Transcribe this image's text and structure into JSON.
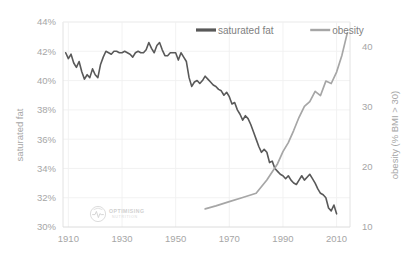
{
  "chart_data": {
    "type": "line",
    "title": "",
    "subtitle": "",
    "xlabel": "",
    "ylabel": "saturated fat",
    "y2label": "obesity (% BMI > 30)",
    "grid": true,
    "legend_position": "top-center",
    "xlim": [
      1908,
      2015
    ],
    "ylim": [
      30,
      44
    ],
    "y2lim": [
      10,
      44
    ],
    "xticks": [
      1910,
      1930,
      1950,
      1970,
      1990,
      2010
    ],
    "xtick_labels": [
      "1910",
      "1930",
      "1950",
      "1970",
      "1990",
      "2010"
    ],
    "yticks": [
      30,
      32,
      34,
      36,
      38,
      40,
      42,
      44
    ],
    "ytick_labels": [
      "30%",
      "32%",
      "34%",
      "36%",
      "38%",
      "40%",
      "42%",
      "44%"
    ],
    "y2ticks": [
      10,
      20,
      30,
      40
    ],
    "y2tick_labels": [
      "10",
      "20",
      "30",
      "40"
    ],
    "series": [
      {
        "name": "saturated fat",
        "axis": "left",
        "color": "#595959",
        "unit": "%",
        "x": [
          1909,
          1910,
          1911,
          1912,
          1913,
          1914,
          1915,
          1916,
          1917,
          1918,
          1919,
          1920,
          1921,
          1922,
          1923,
          1924,
          1925,
          1926,
          1927,
          1928,
          1929,
          1930,
          1931,
          1932,
          1933,
          1934,
          1935,
          1936,
          1937,
          1938,
          1939,
          1940,
          1941,
          1942,
          1943,
          1944,
          1945,
          1946,
          1947,
          1948,
          1949,
          1950,
          1951,
          1952,
          1953,
          1954,
          1955,
          1956,
          1957,
          1958,
          1959,
          1960,
          1961,
          1962,
          1963,
          1964,
          1965,
          1966,
          1967,
          1968,
          1969,
          1970,
          1971,
          1972,
          1973,
          1974,
          1975,
          1976,
          1977,
          1978,
          1979,
          1980,
          1981,
          1982,
          1983,
          1984,
          1985,
          1986,
          1987,
          1988,
          1989,
          1990,
          1991,
          1992,
          1993,
          1994,
          1995,
          1996,
          1997,
          1998,
          1999,
          2000,
          2001,
          2002,
          2003,
          2004,
          2005,
          2006,
          2007,
          2008,
          2009,
          2010
        ],
        "values": [
          41.9,
          41.5,
          41.8,
          41.2,
          40.9,
          41.3,
          40.6,
          40.1,
          40.4,
          40.2,
          40.8,
          40.4,
          40.2,
          41.1,
          41.6,
          42.0,
          41.9,
          41.8,
          42.0,
          42.0,
          41.9,
          41.9,
          42.0,
          41.9,
          41.8,
          41.6,
          41.9,
          42.0,
          41.9,
          41.9,
          42.1,
          42.6,
          42.2,
          41.9,
          42.4,
          42.6,
          42.1,
          41.7,
          41.7,
          41.9,
          41.9,
          41.9,
          41.4,
          41.9,
          41.6,
          41.3,
          40.2,
          39.6,
          39.9,
          40.0,
          39.8,
          40.0,
          40.3,
          40.1,
          39.9,
          39.7,
          39.6,
          39.4,
          39.3,
          39.0,
          39.2,
          38.9,
          38.4,
          38.5,
          38.0,
          37.7,
          37.3,
          37.6,
          37.4,
          37.0,
          36.5,
          36.0,
          35.5,
          35.1,
          35.3,
          35.1,
          34.4,
          34.5,
          34.0,
          33.8,
          33.6,
          33.5,
          33.3,
          33.5,
          33.2,
          33.0,
          32.9,
          33.2,
          33.5,
          33.2,
          33.4,
          33.6,
          33.3,
          33.0,
          32.6,
          32.3,
          32.2,
          32.0,
          31.3,
          31.1,
          31.5,
          30.9
        ]
      },
      {
        "name": "obesity",
        "axis": "right",
        "color": "#a6a6a6",
        "unit": "% BMI > 30",
        "x": [
          1961,
          1965,
          1970,
          1975,
          1980,
          1984,
          1988,
          1990,
          1992,
          1994,
          1996,
          1998,
          2000,
          2002,
          2004,
          2006,
          2008,
          2010,
          2012,
          2014
        ],
        "values": [
          13.0,
          13.5,
          14.2,
          14.9,
          15.6,
          17.8,
          20.5,
          22.5,
          24.0,
          26.0,
          28.2,
          30.0,
          30.8,
          32.5,
          31.8,
          34.2,
          33.8,
          35.7,
          38.5,
          42.2
        ]
      }
    ],
    "legend": [
      {
        "label": "saturated fat",
        "color": "#595959"
      },
      {
        "label": "obesity",
        "color": "#a6a6a6"
      }
    ],
    "watermark": {
      "line1": "OPTIMISING",
      "line2": "NUTRITION"
    }
  }
}
